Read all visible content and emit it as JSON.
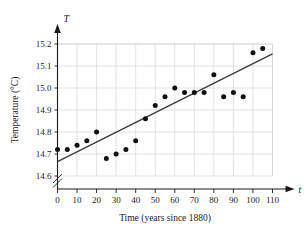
{
  "chart_data": {
    "type": "scatter",
    "title": "",
    "xlabel": "Time (years since 1880)",
    "ylabel": "Temperature (°C)",
    "x_axis_variable": "t",
    "y_axis_variable": "T",
    "xlim": [
      0,
      110
    ],
    "ylim": [
      14.6,
      15.2
    ],
    "xticks": [
      0,
      10,
      20,
      30,
      40,
      50,
      60,
      70,
      80,
      90,
      100,
      110
    ],
    "xtick_labels": [
      "0",
      "10",
      "20",
      "30",
      "40",
      "50",
      "60",
      "70",
      "80",
      "90",
      "100",
      "110"
    ],
    "yticks": [
      14.6,
      14.7,
      14.8,
      14.9,
      15.0,
      15.1,
      15.2
    ],
    "ytick_labels": [
      "14.6",
      "14.7",
      "14.8",
      "14.9",
      "15.0",
      "15.1",
      "15.2"
    ],
    "grid": true,
    "legend": "none",
    "y_axis_break": true,
    "y_axis_break_symbol": "≠",
    "x": [
      0,
      5,
      10,
      15,
      20,
      25,
      30,
      35,
      40,
      45,
      50,
      55,
      60,
      65,
      70,
      75,
      80,
      85,
      90,
      95,
      100,
      105
    ],
    "values": [
      14.72,
      14.72,
      14.74,
      14.76,
      14.8,
      14.68,
      14.7,
      14.72,
      14.76,
      14.86,
      14.92,
      14.96,
      15.0,
      14.98,
      14.98,
      14.98,
      15.06,
      14.96,
      14.98,
      14.96,
      15.16,
      15.18
    ],
    "series": [
      {
        "name": "Annual mean temperature",
        "marker": "filled-circle",
        "color": "#111111",
        "points": [
          {
            "x": 0,
            "y": 14.72
          },
          {
            "x": 5,
            "y": 14.72
          },
          {
            "x": 10,
            "y": 14.74
          },
          {
            "x": 15,
            "y": 14.76
          },
          {
            "x": 20,
            "y": 14.8
          },
          {
            "x": 25,
            "y": 14.68
          },
          {
            "x": 30,
            "y": 14.7
          },
          {
            "x": 35,
            "y": 14.72
          },
          {
            "x": 40,
            "y": 14.76
          },
          {
            "x": 45,
            "y": 14.86
          },
          {
            "x": 50,
            "y": 14.92
          },
          {
            "x": 55,
            "y": 14.96
          },
          {
            "x": 60,
            "y": 15.0
          },
          {
            "x": 65,
            "y": 14.98
          },
          {
            "x": 70,
            "y": 14.98
          },
          {
            "x": 75,
            "y": 14.98
          },
          {
            "x": 80,
            "y": 15.06
          },
          {
            "x": 85,
            "y": 14.96
          },
          {
            "x": 90,
            "y": 14.98
          },
          {
            "x": 95,
            "y": 14.96
          },
          {
            "x": 100,
            "y": 15.16
          },
          {
            "x": 105,
            "y": 15.18
          }
        ]
      }
    ],
    "trendline": {
      "name": "least-squares regression line",
      "color": "#3a3a3a",
      "x_start": 0,
      "y_start": 14.665,
      "x_end": 110,
      "y_end": 15.155
    }
  }
}
